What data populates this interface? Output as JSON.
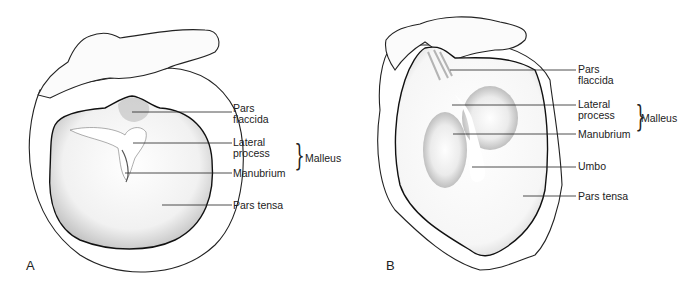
{
  "figure": {
    "panels": [
      {
        "id": "A",
        "letter": "A",
        "labels": {
          "pars_flaccida_1": "Pars",
          "pars_flaccida_2": "flaccida",
          "lateral_process_1": "Lateral",
          "lateral_process_2": "process",
          "manubrium": "Manubrium",
          "malleus": "Malleus",
          "pars_tensa": "Pars tensa"
        }
      },
      {
        "id": "B",
        "letter": "B",
        "labels": {
          "pars_flaccida_1": "Pars",
          "pars_flaccida_2": "flaccida",
          "lateral_process_1": "Lateral",
          "lateral_process_2": "process",
          "manubrium": "Manubrium",
          "malleus": "Malleus",
          "umbo": "Umbo",
          "pars_tensa": "Pars tensa"
        }
      }
    ],
    "brace_glyph": "}"
  }
}
